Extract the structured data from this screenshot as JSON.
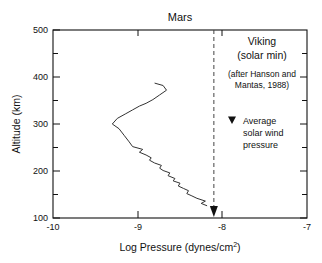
{
  "chart_data": {
    "type": "line",
    "title": "Mars",
    "xlabel": "Log Pressure (dynes/cm",
    "xlabel_sup": "2",
    "xlabel_tail": ")",
    "ylabel": "Altitude (km)",
    "xlim": [
      -10,
      -7
    ],
    "ylim": [
      100,
      500
    ],
    "xticks": [
      -10,
      -9,
      -8,
      -7
    ],
    "xtick_labels": [
      "-10",
      "-9",
      "-8",
      "-7"
    ],
    "yticks": [
      100,
      200,
      300,
      400,
      500
    ],
    "ytick_labels": [
      "100",
      "200",
      "300",
      "400",
      "500"
    ],
    "yminorticks": [
      150,
      250,
      350,
      450
    ],
    "grid": false,
    "legend": "none",
    "series": [
      {
        "name": "Viking solar min pressure profile",
        "x": [
          -8.18,
          -8.25,
          -8.2,
          -8.3,
          -8.36,
          -8.42,
          -8.4,
          -8.46,
          -8.52,
          -8.5,
          -8.58,
          -8.56,
          -8.64,
          -8.62,
          -8.7,
          -8.74,
          -8.72,
          -8.8,
          -8.86,
          -8.84,
          -8.9,
          -8.98,
          -8.94,
          -9.06,
          -9.1,
          -9.16,
          -9.22,
          -9.3,
          -9.24,
          -9.14,
          -9.06,
          -8.98,
          -8.9,
          -8.82,
          -8.74,
          -8.66,
          -8.7,
          -8.8
        ],
        "y": [
          126,
          131,
          136,
          142,
          147,
          152,
          158,
          163,
          168,
          174,
          179,
          184,
          190,
          196,
          201,
          206,
          212,
          217,
          223,
          228,
          234,
          240,
          246,
          252,
          262,
          276,
          290,
          300,
          312,
          322,
          330,
          338,
          344,
          352,
          362,
          372,
          382,
          387
        ],
        "units_x": "log10 dynes/cm^2",
        "units_y": "km"
      }
    ],
    "reference_line": {
      "name": "Average solar wind pressure",
      "x": -8.1,
      "style": "dashed",
      "marker": "filled-down-triangle",
      "marker_y": 100
    },
    "annotations": {
      "source_line1": "Viking",
      "source_line2": "(solar min)",
      "source_line3": "(after Hanson and",
      "source_line4": "Mantas, 1988)",
      "marker_glyph": "▼",
      "marker_line1": "Average",
      "marker_line2": "solar wind",
      "marker_line3": "pressure"
    },
    "colors": {
      "axis": "#111111",
      "curve": "#333333",
      "dashed_line": "#444444",
      "background": "#ffffff"
    }
  }
}
